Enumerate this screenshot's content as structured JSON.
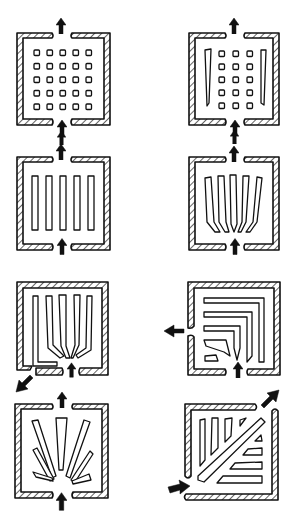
{
  "figure": {
    "panels": [
      {
        "id": "a",
        "description": "Grid of square blocks, inlet bottom center, outlet top center",
        "blocks": "5x5 squares",
        "inlet": "bottom",
        "outlet": "top"
      },
      {
        "id": "b",
        "description": "Grid of squares flanked by two tall tapered baffles, inlet bottom, outlet top",
        "blocks": "3x5 squares + 2 side baffles",
        "inlet": "bottom",
        "outlet": "top"
      },
      {
        "id": "c",
        "description": "Five parallel vertical bars, inlet bottom, outlet top",
        "blocks": "5 vertical bars",
        "inlet": "bottom",
        "outlet": "top"
      },
      {
        "id": "d",
        "description": "Five vertical fins converging toward bottom inlet, outlet top",
        "blocks": "5 converging fins",
        "inlet": "bottom",
        "outlet": "top"
      },
      {
        "id": "e",
        "description": "Closed top; fins fan out from bottom inlet, outlet bottom-left",
        "blocks": "5 fanning fins",
        "inlet": "bottom",
        "outlet": "bottom-left"
      },
      {
        "id": "f",
        "description": "Nested L-shaped guides, inlet bottom, outlet left side",
        "blocks": "nested L guides",
        "inlet": "bottom",
        "outlet": "left"
      },
      {
        "id": "g",
        "description": "Radial wedge fins fanning from bottom inlet, outlet top",
        "blocks": "7 radial wedges",
        "inlet": "bottom",
        "outlet": "top"
      },
      {
        "id": "h",
        "description": "Diagonal splitter with angled fins, inlet bottom-left, outlet top-right",
        "blocks": "diagonal bar + fins",
        "inlet": "bottom-left",
        "outlet": "top-right"
      }
    ]
  }
}
